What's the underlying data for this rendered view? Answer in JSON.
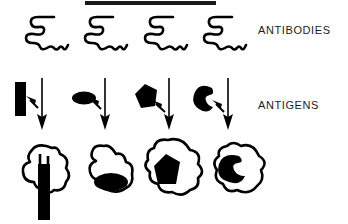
{
  "figure": {
    "background_color": "#ffffff",
    "ink_color": "#000000",
    "width": 348,
    "height": 224,
    "top_rule": {
      "x": 85,
      "y": 1,
      "width": 131,
      "height": 4
    }
  },
  "labels": {
    "antibodies": "ANTIBODIES",
    "antigens": "ANTIGENS"
  },
  "rows": [
    {
      "name": "antibodies-row",
      "label": "ANTIBODIES",
      "label_x": 258,
      "label_y": 24,
      "y": 12,
      "columns": [
        {
          "name": "antibody-1",
          "x": 20,
          "shape": "antibody-squiggle"
        },
        {
          "name": "antibody-2",
          "x": 79,
          "shape": "antibody-squiggle"
        },
        {
          "name": "antibody-3",
          "x": 139,
          "shape": "antibody-squiggle"
        },
        {
          "name": "antibody-4",
          "x": 198,
          "shape": "antibody-squiggle"
        }
      ]
    },
    {
      "name": "antigens-row",
      "label": "ANTIGENS",
      "label_x": 258,
      "label_y": 99,
      "y": 76,
      "columns": [
        {
          "name": "antigen-1",
          "x": 12,
          "shape": "black-bar"
        },
        {
          "name": "antigen-2",
          "x": 71,
          "shape": "black-ellipse"
        },
        {
          "name": "antigen-3",
          "x": 131,
          "shape": "black-polygon"
        },
        {
          "name": "antigen-4",
          "x": 190,
          "shape": "black-crescent"
        }
      ]
    },
    {
      "name": "complexes-row",
      "label": "",
      "y": 140,
      "columns": [
        {
          "name": "complex-1",
          "x": 14,
          "shape": "antibody-bound-bar"
        },
        {
          "name": "complex-2",
          "x": 80,
          "shape": "antibody-bound-ellipse"
        },
        {
          "name": "complex-3",
          "x": 142,
          "shape": "antibody-bound-polygon"
        },
        {
          "name": "complex-4",
          "x": 207,
          "shape": "antibody-bound-crescent"
        }
      ]
    }
  ],
  "icons": {
    "antibody": "antibody-squiggle-icon",
    "bar_antigen": "bar-antigen-icon",
    "ellipse_antigen": "ellipse-antigen-icon",
    "polygon_antigen": "polygon-antigen-icon",
    "crescent_antigen": "crescent-antigen-icon",
    "short_arrow": "short-diagonal-arrow-icon",
    "long_arrow": "long-down-arrow-icon"
  }
}
